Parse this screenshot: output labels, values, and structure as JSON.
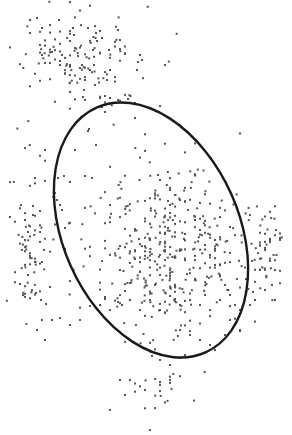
{
  "chart_data": {
    "type": "scatter",
    "title": "",
    "xlabel": "",
    "ylabel": "",
    "axes_visible": false,
    "grid": false,
    "legend": null,
    "colors": {
      "points": "#555555",
      "ellipse": "#1a1a1a",
      "background": "#ffffff"
    },
    "ellipse": {
      "cx": 151,
      "cy": 230,
      "rx": 88,
      "ry": 134,
      "rotation_deg": -24
    },
    "clusters": [
      {
        "name": "top-cluster",
        "cx": 80,
        "cy": 60,
        "sx": 42,
        "sy": 30,
        "n": 120
      },
      {
        "name": "core-cluster",
        "cx": 160,
        "cy": 250,
        "sx": 55,
        "sy": 55,
        "n": 420
      },
      {
        "name": "left-wing",
        "cx": 30,
        "cy": 250,
        "sx": 14,
        "sy": 45,
        "n": 70
      },
      {
        "name": "right-wing",
        "cx": 262,
        "cy": 250,
        "sx": 14,
        "sy": 30,
        "n": 50
      },
      {
        "name": "bottom-tail",
        "cx": 160,
        "cy": 380,
        "sx": 20,
        "sy": 25,
        "n": 20
      }
    ],
    "sample_points": [
      [
        30,
        20
      ],
      [
        37,
        18
      ],
      [
        42,
        28
      ],
      [
        30,
        33
      ],
      [
        50,
        25
      ],
      [
        59,
        20
      ],
      [
        73,
        28
      ],
      [
        74,
        35
      ],
      [
        88,
        28
      ],
      [
        96,
        33
      ],
      [
        97,
        41
      ],
      [
        102,
        38
      ],
      [
        118,
        30
      ],
      [
        120,
        40
      ],
      [
        40,
        45
      ],
      [
        42,
        55
      ],
      [
        52,
        52
      ],
      [
        62,
        55
      ],
      [
        60,
        61
      ],
      [
        75,
        48
      ],
      [
        78,
        56
      ],
      [
        82,
        65
      ],
      [
        93,
        50
      ],
      [
        94,
        65
      ],
      [
        109,
        50
      ],
      [
        125,
        54
      ],
      [
        140,
        55
      ],
      [
        142,
        60
      ],
      [
        138,
        62
      ],
      [
        137,
        70
      ],
      [
        45,
        63
      ],
      [
        50,
        63
      ],
      [
        60,
        65
      ],
      [
        70,
        65
      ],
      [
        80,
        68
      ],
      [
        90,
        70
      ],
      [
        105,
        72
      ],
      [
        107,
        80
      ],
      [
        85,
        80
      ],
      [
        84,
        90
      ],
      [
        83,
        97
      ],
      [
        100,
        98
      ],
      [
        110,
        98
      ],
      [
        118,
        100
      ],
      [
        128,
        99
      ],
      [
        135,
        103
      ],
      [
        102,
        107
      ],
      [
        105,
        112
      ],
      [
        89,
        129
      ],
      [
        88,
        131
      ],
      [
        96,
        145
      ],
      [
        75,
        150
      ],
      [
        85,
        176
      ],
      [
        92,
        178
      ],
      [
        58,
        178
      ],
      [
        64,
        176
      ],
      [
        70,
        182
      ],
      [
        57,
        200
      ],
      [
        60,
        205
      ],
      [
        62,
        210
      ],
      [
        33,
        206
      ],
      [
        40,
        211
      ],
      [
        25,
        220
      ],
      [
        33,
        215
      ],
      [
        28,
        232
      ],
      [
        40,
        232
      ],
      [
        25,
        240
      ],
      [
        22,
        250
      ],
      [
        30,
        256
      ],
      [
        35,
        262
      ],
      [
        42,
        262
      ],
      [
        28,
        275
      ],
      [
        32,
        290
      ],
      [
        36,
        293
      ],
      [
        41,
        300
      ],
      [
        46,
        304
      ],
      [
        42,
        320
      ],
      [
        37,
        330
      ],
      [
        52,
        320
      ],
      [
        60,
        318
      ],
      [
        70,
        325
      ],
      [
        80,
        320
      ],
      [
        90,
        306
      ],
      [
        100,
        305
      ],
      [
        110,
        310
      ],
      [
        118,
        302
      ],
      [
        122,
        305
      ],
      [
        130,
        300
      ],
      [
        140,
        310
      ],
      [
        150,
        300
      ],
      [
        160,
        310
      ],
      [
        170,
        296
      ],
      [
        180,
        305
      ],
      [
        190,
        300
      ],
      [
        200,
        305
      ],
      [
        210,
        310
      ],
      [
        220,
        300
      ],
      [
        230,
        320
      ],
      [
        240,
        310
      ],
      [
        250,
        305
      ],
      [
        255,
        300
      ],
      [
        265,
        290
      ],
      [
        272,
        285
      ],
      [
        275,
        300
      ],
      [
        260,
        270
      ],
      [
        265,
        250
      ],
      [
        270,
        240
      ],
      [
        276,
        230
      ],
      [
        280,
        240
      ],
      [
        158,
        175
      ],
      [
        160,
        180
      ],
      [
        170,
        190
      ],
      [
        175,
        195
      ],
      [
        180,
        200
      ],
      [
        188,
        210
      ],
      [
        195,
        220
      ],
      [
        200,
        230
      ],
      [
        205,
        245
      ],
      [
        210,
        255
      ],
      [
        215,
        265
      ],
      [
        220,
        275
      ],
      [
        225,
        285
      ],
      [
        230,
        295
      ],
      [
        235,
        305
      ],
      [
        180,
        330
      ],
      [
        190,
        335
      ],
      [
        200,
        340
      ],
      [
        210,
        345
      ],
      [
        215,
        350
      ],
      [
        225,
        335
      ],
      [
        240,
        330
      ],
      [
        152,
        356
      ],
      [
        160,
        360
      ],
      [
        170,
        365
      ],
      [
        180,
        358
      ],
      [
        120,
        380
      ],
      [
        125,
        395
      ],
      [
        130,
        380
      ],
      [
        145,
        390
      ],
      [
        160,
        382
      ],
      [
        170,
        380
      ],
      [
        110,
        410
      ],
      [
        150,
        430
      ]
    ]
  }
}
